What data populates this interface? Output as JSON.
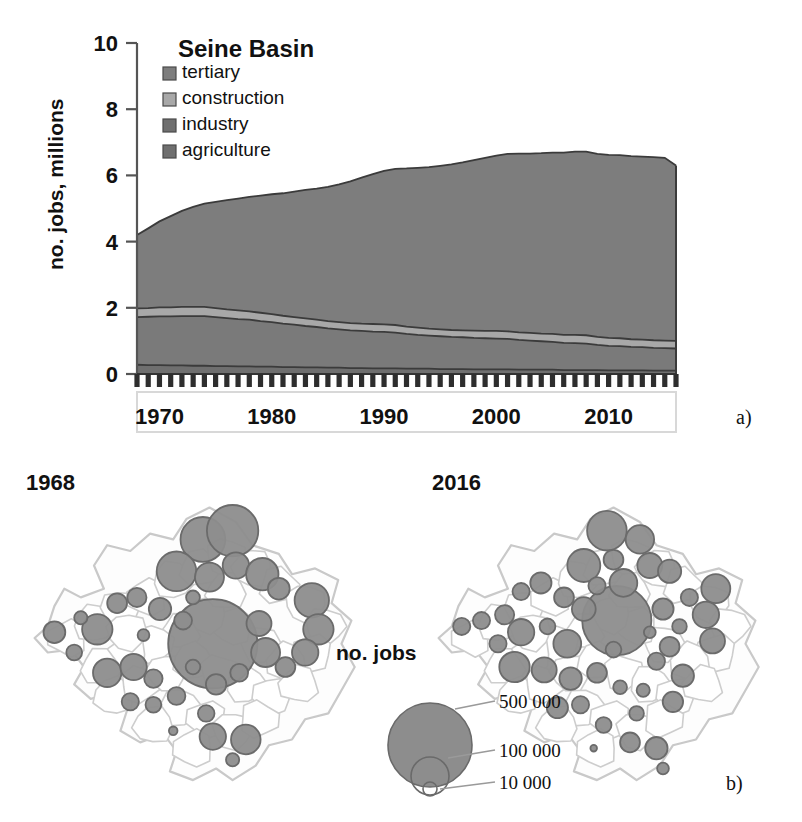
{
  "figure": {
    "panel_a_letter": "a)",
    "panel_b_letter": "b)"
  },
  "panel_a": {
    "title": "Seine Basin",
    "ylabel": "no. jobs, millions",
    "legend": [
      {
        "label": "tertiary",
        "color": "#7d7d7d"
      },
      {
        "label": "construction",
        "color": "#a8a8a8"
      },
      {
        "label": "industry",
        "color": "#6f6f6f"
      },
      {
        "label": "agriculture",
        "color": "#6f6f6f"
      }
    ]
  },
  "panel_b": {
    "left_map_year": "1968",
    "right_map_year": "2016",
    "caption": "no. jobs",
    "size_legend": [
      {
        "label": "500 000"
      },
      {
        "label": "100 000"
      },
      {
        "label": "10 000"
      }
    ]
  },
  "chart_data": {
    "type": "area",
    "title": "Seine Basin",
    "xlabel": "",
    "ylabel": "no. jobs, millions",
    "xlim": [
      1968,
      2016
    ],
    "ylim": [
      0,
      10
    ],
    "yticks": [
      0,
      2,
      4,
      6,
      8,
      10
    ],
    "xticks": [
      1970,
      1980,
      1990,
      2000,
      2010
    ],
    "xtick_minor_step": 1,
    "grid": false,
    "legend_position": "top-left",
    "stacked": true,
    "stack_order_bottom_to_top": [
      "agriculture",
      "industry",
      "construction",
      "tertiary"
    ],
    "x": [
      1968,
      1969,
      1970,
      1971,
      1972,
      1973,
      1974,
      1975,
      1976,
      1977,
      1978,
      1979,
      1980,
      1981,
      1982,
      1983,
      1984,
      1985,
      1986,
      1987,
      1988,
      1989,
      1990,
      1991,
      1992,
      1993,
      1994,
      1995,
      1996,
      1997,
      1998,
      1999,
      2000,
      2001,
      2002,
      2003,
      2004,
      2005,
      2006,
      2007,
      2008,
      2009,
      2010,
      2011,
      2012,
      2013,
      2014,
      2015,
      2016
    ],
    "series": [
      {
        "name": "agriculture",
        "color": "#6f6f6f",
        "values": [
          0.28,
          0.27,
          0.27,
          0.26,
          0.26,
          0.25,
          0.25,
          0.24,
          0.24,
          0.23,
          0.23,
          0.22,
          0.22,
          0.21,
          0.21,
          0.2,
          0.2,
          0.19,
          0.19,
          0.18,
          0.18,
          0.17,
          0.17,
          0.17,
          0.16,
          0.16,
          0.16,
          0.15,
          0.15,
          0.15,
          0.14,
          0.14,
          0.14,
          0.14,
          0.13,
          0.13,
          0.13,
          0.13,
          0.12,
          0.12,
          0.12,
          0.12,
          0.11,
          0.11,
          0.11,
          0.11,
          0.1,
          0.1,
          0.1
        ]
      },
      {
        "name": "industry",
        "color": "#7a7a7a",
        "values": [
          1.44,
          1.46,
          1.47,
          1.48,
          1.49,
          1.5,
          1.5,
          1.48,
          1.45,
          1.43,
          1.41,
          1.38,
          1.35,
          1.31,
          1.28,
          1.25,
          1.22,
          1.19,
          1.16,
          1.14,
          1.12,
          1.11,
          1.1,
          1.08,
          1.05,
          1.02,
          1.0,
          0.99,
          0.97,
          0.96,
          0.95,
          0.94,
          0.93,
          0.92,
          0.9,
          0.88,
          0.86,
          0.84,
          0.82,
          0.81,
          0.8,
          0.76,
          0.74,
          0.73,
          0.71,
          0.7,
          0.69,
          0.68,
          0.67
        ]
      },
      {
        "name": "construction",
        "color": "#a8a8a8",
        "values": [
          0.26,
          0.26,
          0.27,
          0.27,
          0.28,
          0.28,
          0.28,
          0.27,
          0.26,
          0.26,
          0.25,
          0.25,
          0.24,
          0.24,
          0.23,
          0.23,
          0.22,
          0.22,
          0.22,
          0.22,
          0.22,
          0.23,
          0.23,
          0.23,
          0.22,
          0.22,
          0.21,
          0.21,
          0.21,
          0.21,
          0.22,
          0.22,
          0.23,
          0.23,
          0.23,
          0.23,
          0.23,
          0.24,
          0.24,
          0.25,
          0.25,
          0.24,
          0.24,
          0.24,
          0.23,
          0.23,
          0.23,
          0.23,
          0.23
        ]
      },
      {
        "name": "tertiary",
        "color": "#7d7d7d",
        "values": [
          2.22,
          2.41,
          2.6,
          2.76,
          2.9,
          3.02,
          3.12,
          3.21,
          3.3,
          3.38,
          3.46,
          3.54,
          3.62,
          3.7,
          3.79,
          3.88,
          3.96,
          4.05,
          4.16,
          4.28,
          4.41,
          4.53,
          4.64,
          4.72,
          4.78,
          4.83,
          4.88,
          4.94,
          5.0,
          5.07,
          5.15,
          5.23,
          5.3,
          5.36,
          5.4,
          5.42,
          5.45,
          5.48,
          5.51,
          5.54,
          5.55,
          5.53,
          5.53,
          5.53,
          5.53,
          5.53,
          5.53,
          5.52,
          5.3
        ]
      }
    ],
    "totals": [
      4.2,
      4.4,
      4.61,
      4.77,
      4.93,
      5.05,
      5.15,
      5.2,
      5.25,
      5.3,
      5.35,
      5.39,
      5.43,
      5.46,
      5.51,
      5.56,
      5.6,
      5.65,
      5.73,
      5.82,
      5.93,
      6.04,
      6.14,
      6.2,
      6.21,
      6.23,
      6.25,
      6.29,
      6.33,
      6.39,
      6.46,
      6.53,
      6.6,
      6.65,
      6.66,
      6.66,
      6.67,
      6.69,
      6.69,
      6.72,
      6.72,
      6.65,
      6.62,
      6.61,
      6.58,
      6.57,
      6.55,
      6.53,
      6.3
    ]
  }
}
